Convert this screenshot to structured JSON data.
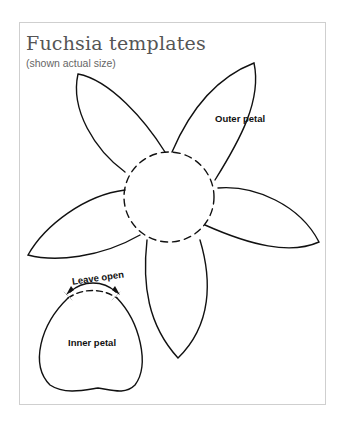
{
  "page": {
    "title": "Fuchsia templates",
    "subtitle": "(shown actual size)"
  },
  "labels": {
    "outer_petal": "Outer petal",
    "inner_petal": "Inner petal",
    "leave_open": "Leave open"
  },
  "colors": {
    "stroke": "#111111",
    "frame_border": "#cfcfcf",
    "title": "#555555"
  }
}
